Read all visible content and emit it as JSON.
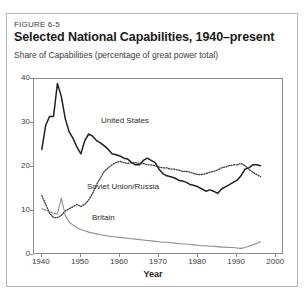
{
  "figure": {
    "number_label": "FIGURE 6-5",
    "title": "Selected National Capabilities, 1940–present",
    "subtitle": "Share of Capabilities (percentage of great power total)"
  },
  "colors": {
    "united_states": "#231f20",
    "soviet_union_russia": "#3a3a3a",
    "britain": "#8e8e8e",
    "axis": "#8c8c8c",
    "frame": "#b9b9b9",
    "text": "#231f20",
    "background": "#ffffff"
  },
  "chart_data": {
    "type": "line",
    "title": "Selected National Capabilities, 1940–present",
    "subtitle": "Share of Capabilities (percentage of great power total)",
    "xlabel": "Year",
    "ylabel": "",
    "xlim": [
      1938,
      2002
    ],
    "ylim": [
      0,
      40
    ],
    "xticks": [
      1940,
      1950,
      1960,
      1970,
      1980,
      1990,
      2000
    ],
    "yticks": [
      0,
      10,
      20,
      30,
      40
    ],
    "grid": false,
    "legend": "inline-annotations",
    "series": [
      {
        "name": "United States",
        "style": "solid",
        "color": "#231f20",
        "line_width": 1.5,
        "label_position": {
          "x": 1956,
          "y": 24.5
        },
        "x": [
          1940,
          1941,
          1942,
          1943,
          1944,
          1945,
          1946,
          1947,
          1948,
          1949,
          1950,
          1951,
          1952,
          1953,
          1954,
          1955,
          1956,
          1957,
          1958,
          1959,
          1960,
          1961,
          1962,
          1963,
          1964,
          1965,
          1966,
          1967,
          1968,
          1969,
          1970,
          1971,
          1972,
          1973,
          1974,
          1975,
          1976,
          1977,
          1978,
          1979,
          1980,
          1981,
          1982,
          1983,
          1984,
          1985,
          1986,
          1987,
          1988,
          1989,
          1990,
          1991,
          1992,
          1993,
          1994,
          1995,
          1996
        ],
        "y": [
          24.0,
          29.5,
          31.5,
          31.5,
          39.0,
          36.0,
          31.0,
          28.0,
          26.5,
          24.5,
          23.0,
          26.0,
          27.5,
          27.0,
          26.0,
          25.5,
          24.8,
          24.0,
          23.0,
          22.8,
          22.5,
          22.0,
          21.8,
          21.0,
          20.5,
          20.5,
          21.5,
          22.0,
          21.5,
          21.0,
          19.5,
          18.5,
          18.0,
          17.8,
          17.5,
          17.0,
          16.8,
          16.5,
          16.0,
          15.8,
          15.5,
          15.0,
          14.5,
          14.8,
          14.5,
          14.0,
          15.0,
          15.5,
          16.0,
          16.5,
          17.0,
          18.0,
          19.5,
          19.8,
          20.5,
          20.5,
          20.3
        ]
      },
      {
        "name": "Soviet Union/Russia",
        "style": "dotted",
        "color": "#3a3a3a",
        "line_width": 1.3,
        "label_position": {
          "x": 1953,
          "y": 14.5
        },
        "x": [
          1940,
          1941,
          1942,
          1943,
          1944,
          1945,
          1946,
          1947,
          1948,
          1949,
          1950,
          1951,
          1952,
          1953,
          1954,
          1955,
          1956,
          1957,
          1958,
          1959,
          1960,
          1961,
          1962,
          1963,
          1964,
          1965,
          1966,
          1967,
          1968,
          1969,
          1970,
          1971,
          1972,
          1973,
          1974,
          1975,
          1976,
          1977,
          1978,
          1979,
          1980,
          1981,
          1982,
          1983,
          1984,
          1985,
          1986,
          1987,
          1988,
          1989,
          1990,
          1991,
          1992,
          1993,
          1994,
          1995,
          1996
        ],
        "y": [
          13.5,
          11.5,
          9.5,
          8.5,
          8.5,
          9.0,
          10.0,
          10.5,
          11.0,
          11.5,
          11.0,
          11.5,
          12.5,
          14.0,
          16.0,
          17.5,
          19.0,
          19.8,
          20.5,
          21.0,
          21.3,
          21.0,
          20.8,
          21.0,
          21.0,
          20.8,
          20.8,
          20.5,
          20.5,
          20.3,
          20.0,
          19.8,
          19.8,
          19.5,
          19.5,
          19.3,
          19.0,
          19.0,
          18.8,
          18.5,
          18.3,
          18.3,
          18.5,
          18.8,
          19.0,
          19.3,
          19.8,
          20.0,
          20.3,
          20.5,
          20.5,
          20.8,
          20.3,
          19.5,
          18.8,
          18.3,
          17.8
        ]
      },
      {
        "name": "Britain",
        "style": "solid",
        "color": "#8e8e8e",
        "line_width": 1.1,
        "label_position": {
          "x": 1951,
          "y": 7.0
        },
        "x": [
          1940,
          1941,
          1942,
          1943,
          1944,
          1945,
          1946,
          1947,
          1948,
          1949,
          1950,
          1951,
          1952,
          1953,
          1954,
          1955,
          1956,
          1957,
          1958,
          1959,
          1960,
          1961,
          1962,
          1963,
          1964,
          1965,
          1966,
          1967,
          1968,
          1969,
          1970,
          1971,
          1972,
          1973,
          1974,
          1975,
          1976,
          1977,
          1978,
          1979,
          1980,
          1981,
          1982,
          1983,
          1984,
          1985,
          1986,
          1987,
          1988,
          1989,
          1990,
          1991,
          1992,
          1993,
          1994,
          1995,
          1996
        ],
        "y": [
          10.5,
          10.2,
          9.8,
          9.5,
          9.3,
          13.0,
          9.0,
          7.5,
          6.8,
          6.2,
          5.8,
          5.5,
          5.2,
          5.0,
          4.8,
          4.6,
          4.5,
          4.3,
          4.2,
          4.1,
          4.0,
          3.9,
          3.8,
          3.7,
          3.6,
          3.5,
          3.4,
          3.3,
          3.2,
          3.1,
          3.0,
          2.9,
          2.9,
          2.8,
          2.7,
          2.6,
          2.5,
          2.5,
          2.4,
          2.3,
          2.2,
          2.1,
          2.1,
          2.0,
          2.0,
          1.9,
          1.8,
          1.8,
          1.7,
          1.7,
          1.6,
          1.5,
          1.7,
          2.0,
          2.3,
          2.6,
          3.0
        ]
      }
    ]
  },
  "axes": {
    "xlabel": "Year",
    "xtick_labels": [
      "1940",
      "1950",
      "1960",
      "1970",
      "1980",
      "1990",
      "2000"
    ],
    "ytick_labels": [
      "0",
      "10",
      "20",
      "30",
      "40"
    ]
  },
  "annotations": [
    {
      "name": "united-states",
      "text": "United States"
    },
    {
      "name": "soviet-union-russia",
      "text": "Soviet Union/Russia"
    },
    {
      "name": "britain",
      "text": "Britain"
    }
  ]
}
